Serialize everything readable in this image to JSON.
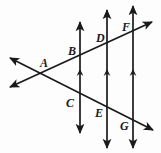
{
  "figure": {
    "type": "geometry-diagram",
    "background_color": "#fdfdfd",
    "stroke_color": "#1a1a1a",
    "width": 161,
    "height": 153
  },
  "labels": [
    {
      "id": "A",
      "text": "A",
      "x": 40,
      "y": 57
    },
    {
      "id": "B",
      "text": "B",
      "x": 68,
      "y": 45
    },
    {
      "id": "C",
      "text": "C",
      "x": 66,
      "y": 97
    },
    {
      "id": "D",
      "text": "D",
      "x": 96,
      "y": 32
    },
    {
      "id": "E",
      "text": "E",
      "x": 95,
      "y": 107
    },
    {
      "id": "F",
      "text": "F",
      "x": 122,
      "y": 21
    },
    {
      "id": "G",
      "text": "G",
      "x": 120,
      "y": 120
    }
  ],
  "parallel_lines": [
    {
      "id": "line-BC",
      "x": 80,
      "y_top": 22,
      "y_bottom": 133,
      "tick_y": 72,
      "arrow_top": true,
      "arrow_bottom": true
    },
    {
      "id": "line-DE",
      "x": 107,
      "y_top": 10,
      "y_bottom": 148,
      "tick_y": 72,
      "arrow_top": true,
      "arrow_bottom": true
    },
    {
      "id": "line-FG",
      "x": 133,
      "y_top": 6,
      "y_bottom": 148,
      "tick_y": 72,
      "arrow_top": true,
      "arrow_bottom": true
    }
  ],
  "transversals": [
    {
      "id": "upper-transversal",
      "description": "passes through A, B, D, F rising to the right",
      "x1": 8,
      "y1": 88,
      "x2": 154,
      "y2": 21,
      "arrow_start": true,
      "arrow_end": true
    },
    {
      "id": "lower-transversal",
      "description": "passes through A, C, E, G falling to the right",
      "x1": 8,
      "y1": 57,
      "x2": 155,
      "y2": 131,
      "arrow_start": true,
      "arrow_end": true
    }
  ],
  "intersections": [
    {
      "id": "A",
      "x": 45,
      "y": 72,
      "description": "crossing of the two transversals"
    },
    {
      "id": "B",
      "x": 80,
      "y": 56,
      "description": "upper transversal meets first parallel"
    },
    {
      "id": "C",
      "x": 80,
      "y": 106,
      "description": "lower transversal meets first parallel"
    },
    {
      "id": "D",
      "x": 107,
      "y": 43,
      "description": "upper transversal meets second parallel"
    },
    {
      "id": "E",
      "x": 107,
      "y": 119,
      "description": "lower transversal meets second parallel"
    },
    {
      "id": "F",
      "x": 133,
      "y": 31,
      "description": "upper transversal meets third parallel"
    },
    {
      "id": "G",
      "x": 133,
      "y": 132,
      "description": "lower transversal meets third parallel"
    }
  ]
}
